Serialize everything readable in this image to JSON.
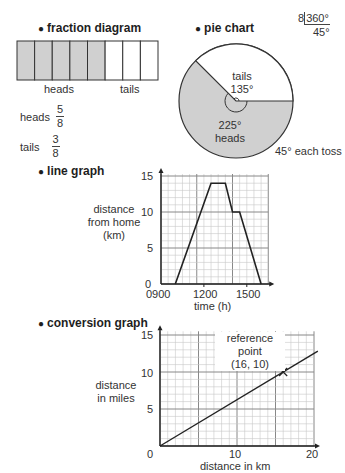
{
  "fraction_diagram": {
    "heading": "fraction diagram",
    "total_cells": 8,
    "heads_cells": 5,
    "label_heads": "heads",
    "label_tails": "tails",
    "heads_row": {
      "label": "heads",
      "num": "5",
      "den": "8"
    },
    "tails_row": {
      "label": "tails",
      "num": "3",
      "den": "8"
    },
    "shade_color": "#d0d0d0"
  },
  "pie_chart": {
    "heading": "pie chart",
    "division": {
      "divisor": "8",
      "dividend": "360°",
      "quotient": "45°"
    },
    "tails_label": "tails",
    "tails_angle": "135°",
    "heads_angle": "225°",
    "heads_label": "heads",
    "note": "45° each toss"
  },
  "line_graph": {
    "heading": "line graph",
    "ylabel_lines": [
      "distance",
      "from home",
      "(km)"
    ],
    "xlabel": "time (h)",
    "y_ticks": [
      "0",
      "5",
      "10",
      "15"
    ],
    "x_ticks": [
      "0900",
      "1200",
      "1500"
    ]
  },
  "conversion_graph": {
    "heading": "conversion graph",
    "ylabel_lines": [
      "distance",
      "in miles"
    ],
    "xlabel": "distance in km",
    "y_ticks": [
      "0",
      "5",
      "10",
      "15"
    ],
    "x_ticks": [
      "10",
      "20"
    ],
    "annotation_lines": [
      "reference",
      "point",
      "(16, 10)"
    ]
  },
  "chart_data": [
    {
      "type": "bar",
      "title": "fraction diagram",
      "categories": [
        "heads",
        "tails"
      ],
      "values": [
        5,
        3
      ],
      "fractions": [
        "5/8",
        "3/8"
      ],
      "layout": "8 equal cells, 5 shaded (heads), 3 unshaded (tails)"
    },
    {
      "type": "pie",
      "title": "pie chart",
      "categories": [
        "heads",
        "tails"
      ],
      "values": [
        225,
        135
      ],
      "units": "degrees",
      "annotations": [
        "8 | 360° = 45°",
        "45° each toss"
      ]
    },
    {
      "type": "line",
      "title": "line graph",
      "xlabel": "time (h)",
      "ylabel": "distance from home (km)",
      "x_ticks": [
        "0900",
        "1200",
        "1500"
      ],
      "y_ticks": [
        0,
        5,
        10,
        15
      ],
      "ylim": [
        0,
        15
      ],
      "xlim": [
        "0900",
        "1630"
      ],
      "grid": true,
      "series": [
        {
          "name": "distance",
          "x": [
            "1000",
            "1230",
            "1330",
            "1400",
            "1430",
            "1600"
          ],
          "values": [
            0,
            14,
            14,
            10,
            10,
            0
          ]
        }
      ]
    },
    {
      "type": "line",
      "title": "conversion graph",
      "xlabel": "distance in km",
      "ylabel": "distance in miles",
      "x_ticks": [
        0,
        10,
        20
      ],
      "y_ticks": [
        0,
        5,
        10,
        15
      ],
      "xlim": [
        0,
        20
      ],
      "ylim": [
        0,
        15
      ],
      "grid": true,
      "series": [
        {
          "name": "miles",
          "x": [
            0,
            16,
            20
          ],
          "values": [
            0,
            10,
            12.5
          ]
        }
      ],
      "annotations": [
        {
          "text": "reference point (16, 10)",
          "x": 16,
          "y": 10
        }
      ]
    }
  ]
}
